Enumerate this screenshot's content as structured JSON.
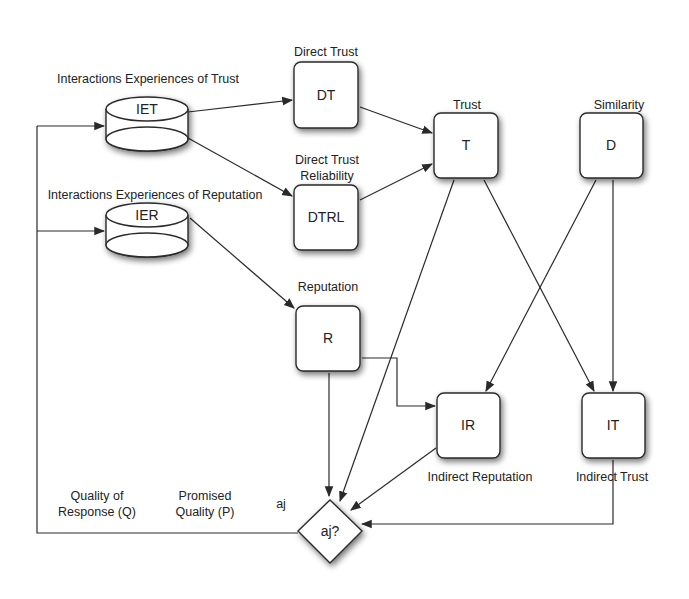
{
  "nodes": {
    "iet": {
      "text": "IET",
      "label": "Interactions Experiences of Trust"
    },
    "ier": {
      "text": "IER",
      "label": "Interactions Experiences of Reputation"
    },
    "dt": {
      "text": "DT",
      "label": "Direct Trust"
    },
    "dtrl": {
      "text": "DTRL",
      "label_line1": "Direct Trust",
      "label_line2": "Reliability"
    },
    "t": {
      "text": "T",
      "label": "Trust"
    },
    "d": {
      "text": "D",
      "label": "Similarity"
    },
    "r": {
      "text": "R",
      "label": "Reputation"
    },
    "ir": {
      "text": "IR",
      "label": "Indirect Reputation"
    },
    "it": {
      "text": "IT",
      "label": "Indirect Trust"
    },
    "decision": {
      "text": "aj?"
    }
  },
  "feedback_labels": {
    "quality_line1": "Quality of",
    "quality_line2": "Response (Q)",
    "promised_line1": "Promised",
    "promised_line2": "Quality (P)",
    "aj": "aj"
  }
}
